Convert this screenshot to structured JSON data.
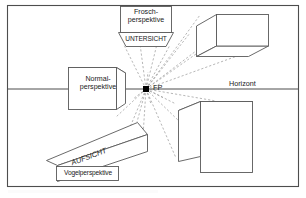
{
  "figure": {
    "frame": {
      "border_color": "#4d4d4d",
      "background": "#ffffff"
    },
    "colors": {
      "line": "#595959",
      "ray": "#9a9a9a",
      "text": "#1a1a1a",
      "horizon": "#4d4d4d",
      "vanishing_point": "#000000"
    }
  },
  "labels": {
    "vanishing_point": "FP",
    "horizon": "Horizont",
    "frosch_line1": "Frosch-",
    "frosch_line2": "perspektive",
    "untersicht": "UNTERSICHT",
    "normal_line1": "Normal-",
    "normal_line2": "perspektive",
    "aufsicht": "AUFSICHT",
    "vogelperspektive": "Vogelperspektive"
  },
  "elements": {
    "top_box_label": "Frosch-perspektive",
    "top_trapezoid_label": "UNTERSICHT",
    "left_box_label": "Normal-perspektive",
    "bottom_parallelogram_label": "AUFSICHT",
    "bottom_box_label": "Vogelperspektive",
    "upper_right_cube": "cube-viewed-from-below",
    "lower_right_cube": "cube-viewed-from-above",
    "horizon_line": "Horizont",
    "vanishing_point_dot": "FP"
  }
}
